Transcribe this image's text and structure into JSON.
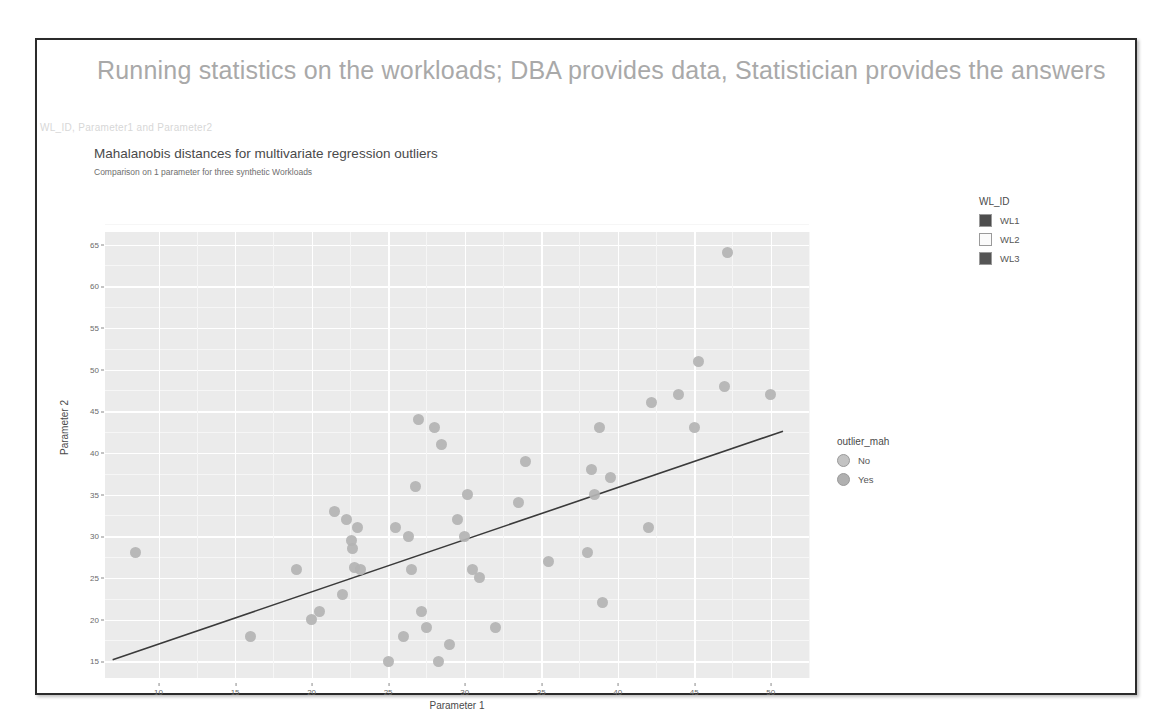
{
  "slide": {
    "title": "Running statistics on the workloads; DBA provides data, Statistician provides the answers",
    "faint_caption": "WL_ID, Parameter1 and Parameter2"
  },
  "chart_header": {
    "title": "Mahalanobis distances for multivariate regression outliers",
    "subtitle": "Comparison on 1 parameter for three synthetic Workloads"
  },
  "legends": {
    "wl_id": {
      "title": "WL_ID",
      "items": [
        {
          "label": "WL1",
          "color": "#4d4d4d"
        },
        {
          "label": "WL2",
          "color": "#fbfbfb"
        },
        {
          "label": "WL3",
          "color": "#555555"
        }
      ]
    },
    "outlier_mah": {
      "title": "outlier_mah",
      "items": [
        {
          "label": "No",
          "color": "#c3c3c3"
        },
        {
          "label": "Yes",
          "color": "#b0b0b0"
        }
      ]
    }
  },
  "chart_data": {
    "type": "scatter",
    "title": "Mahalanobis distances for multivariate regression outliers",
    "subtitle": "Comparison on 1 parameter for three synthetic Workloads",
    "xlabel": "Parameter 1",
    "ylabel": "Parameter 2",
    "xlim": [
      6.5,
      52.5
    ],
    "ylim": [
      13.0,
      66.5
    ],
    "xticks": [
      10,
      15,
      20,
      25,
      30,
      35,
      40,
      45,
      50
    ],
    "yticks": [
      15,
      20,
      25,
      30,
      35,
      40,
      45,
      50,
      55,
      60,
      65
    ],
    "grid": true,
    "legend_position": "right",
    "point_color": "#b3b3b3",
    "fit_line": {
      "color": "#3a3a3a",
      "x_start": 7.0,
      "y_start": 15.2,
      "x_end": 50.8,
      "y_end": 42.6
    },
    "points": [
      {
        "x": 8.5,
        "y": 28.0
      },
      {
        "x": 16.0,
        "y": 18.0
      },
      {
        "x": 19.0,
        "y": 26.0
      },
      {
        "x": 20.0,
        "y": 20.0
      },
      {
        "x": 20.5,
        "y": 21.0
      },
      {
        "x": 21.5,
        "y": 33.0
      },
      {
        "x": 22.0,
        "y": 23.0
      },
      {
        "x": 22.3,
        "y": 32.0
      },
      {
        "x": 22.6,
        "y": 29.5
      },
      {
        "x": 22.7,
        "y": 28.5
      },
      {
        "x": 22.8,
        "y": 26.3
      },
      {
        "x": 23.0,
        "y": 31.0
      },
      {
        "x": 23.2,
        "y": 26.0
      },
      {
        "x": 25.0,
        "y": 15.0
      },
      {
        "x": 25.5,
        "y": 31.0
      },
      {
        "x": 26.0,
        "y": 18.0
      },
      {
        "x": 26.3,
        "y": 30.0
      },
      {
        "x": 26.5,
        "y": 26.0
      },
      {
        "x": 26.8,
        "y": 36.0
      },
      {
        "x": 27.0,
        "y": 44.0
      },
      {
        "x": 27.2,
        "y": 21.0
      },
      {
        "x": 27.5,
        "y": 19.0
      },
      {
        "x": 28.0,
        "y": 43.0
      },
      {
        "x": 28.3,
        "y": 15.0
      },
      {
        "x": 28.5,
        "y": 41.0
      },
      {
        "x": 29.0,
        "y": 17.0
      },
      {
        "x": 29.5,
        "y": 32.0
      },
      {
        "x": 30.0,
        "y": 30.0
      },
      {
        "x": 30.2,
        "y": 35.0
      },
      {
        "x": 30.5,
        "y": 26.0
      },
      {
        "x": 31.0,
        "y": 25.0
      },
      {
        "x": 32.0,
        "y": 19.0
      },
      {
        "x": 33.5,
        "y": 34.0
      },
      {
        "x": 34.0,
        "y": 39.0
      },
      {
        "x": 35.5,
        "y": 27.0
      },
      {
        "x": 38.0,
        "y": 28.0
      },
      {
        "x": 38.3,
        "y": 38.0
      },
      {
        "x": 38.5,
        "y": 35.0
      },
      {
        "x": 38.8,
        "y": 43.0
      },
      {
        "x": 39.0,
        "y": 22.0
      },
      {
        "x": 39.5,
        "y": 37.0
      },
      {
        "x": 42.0,
        "y": 31.0
      },
      {
        "x": 42.2,
        "y": 46.0
      },
      {
        "x": 44.0,
        "y": 47.0
      },
      {
        "x": 45.0,
        "y": 43.0
      },
      {
        "x": 45.3,
        "y": 51.0
      },
      {
        "x": 47.0,
        "y": 48.0
      },
      {
        "x": 47.2,
        "y": 64.0
      },
      {
        "x": 50.0,
        "y": 47.0
      }
    ]
  }
}
